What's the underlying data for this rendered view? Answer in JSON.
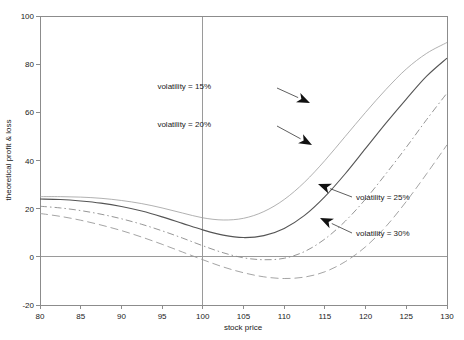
{
  "chart_data": {
    "type": "line",
    "title": "",
    "xlabel": "stock price",
    "ylabel": "theoretical profit & loss",
    "xlim": [
      80,
      130
    ],
    "ylim": [
      -20,
      100
    ],
    "xticks": [
      80,
      85,
      90,
      95,
      100,
      105,
      110,
      115,
      120,
      125,
      130
    ],
    "yticks": [
      -20,
      0,
      20,
      40,
      60,
      80,
      100
    ],
    "grid": false,
    "legend_position": "inline-annotations",
    "reference_lines": [
      {
        "axis": "y",
        "value": 0
      },
      {
        "axis": "x",
        "value": 100
      }
    ],
    "x": [
      80,
      82.5,
      85,
      87.5,
      90,
      92.5,
      95,
      97.5,
      100,
      102.5,
      105,
      107.5,
      110,
      112.5,
      115,
      117.5,
      120,
      122.5,
      125,
      127.5,
      130
    ],
    "series": [
      {
        "name": "volatility = 15%",
        "color": "#9d9d9d",
        "style": "solid-thin",
        "values": [
          25.0,
          25.0,
          24.8,
          24.3,
          23.4,
          22.1,
          20.3,
          18.2,
          16.2,
          15.3,
          16.0,
          18.8,
          23.8,
          31.0,
          40.0,
          50.0,
          60.0,
          69.5,
          78.0,
          84.5,
          89.0
        ]
      },
      {
        "name": "volatility = 20%",
        "color": "#555555",
        "style": "solid",
        "values": [
          24.0,
          23.8,
          23.2,
          22.3,
          20.9,
          19.0,
          16.6,
          13.9,
          11.2,
          9.0,
          8.0,
          8.8,
          11.8,
          17.2,
          25.0,
          34.5,
          45.0,
          55.5,
          65.5,
          75.0,
          82.5
        ]
      },
      {
        "name": "volatility = 25%",
        "color": "#8a8a8a",
        "style": "dashdot",
        "values": [
          21.0,
          20.3,
          19.2,
          17.7,
          15.8,
          13.5,
          10.8,
          7.8,
          4.6,
          1.7,
          -0.4,
          -1.2,
          -0.6,
          2.2,
          7.4,
          14.8,
          24.0,
          34.5,
          45.5,
          57.0,
          68.0
        ]
      },
      {
        "name": "volatility = 30%",
        "color": "#9a9a9a",
        "style": "dashed",
        "values": [
          18.0,
          16.8,
          15.2,
          13.2,
          10.9,
          8.2,
          5.2,
          2.0,
          -1.2,
          -4.2,
          -6.6,
          -8.3,
          -9.0,
          -8.4,
          -6.2,
          -2.0,
          4.2,
          12.6,
          23.0,
          34.5,
          46.5
        ]
      }
    ],
    "annotations": [
      {
        "text": "volatility = 15%",
        "label_x": 211,
        "label_y": 89,
        "leader_from": [
          277,
          88
        ],
        "leader_to": [
          310,
          103
        ],
        "arrow_angle_deg": 24
      },
      {
        "text": "volatility = 20%",
        "label_x": 211,
        "label_y": 127,
        "leader_from": [
          277,
          126
        ],
        "leader_to": [
          312,
          145
        ],
        "arrow_angle_deg": 29
      },
      {
        "text": "volatility = 25%",
        "label_x": 356,
        "label_y": 200,
        "leader_from": [
          352,
          197
        ],
        "leader_to": [
          318,
          184
        ],
        "arrow_angle_deg": 201
      },
      {
        "text": "volatility = 30%",
        "label_x": 356,
        "label_y": 236,
        "leader_from": [
          352,
          233
        ],
        "leader_to": [
          320,
          218
        ],
        "arrow_angle_deg": 205
      }
    ]
  },
  "plot_geometry": {
    "left": 40,
    "right": 447,
    "top": 16,
    "bottom": 305
  }
}
